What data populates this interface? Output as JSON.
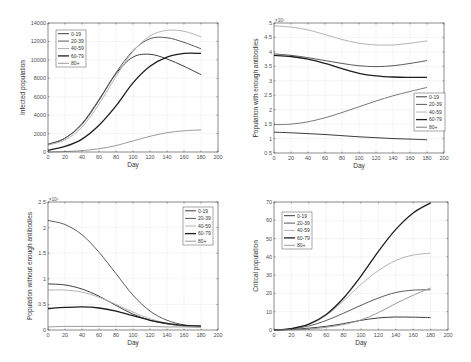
{
  "chart_data": [
    {
      "type": "line",
      "id": "infected",
      "title": "",
      "xlabel": "Day",
      "ylabel": "Infected population",
      "xlim": [
        0,
        200
      ],
      "ylim": [
        0,
        14000
      ],
      "xticks": [
        0,
        20,
        40,
        60,
        80,
        100,
        120,
        140,
        160,
        180,
        200
      ],
      "yticks": [
        0,
        2000,
        4000,
        6000,
        8000,
        10000,
        12000,
        14000
      ],
      "ytick_labels": [
        "0",
        "2000",
        "4000",
        "6000",
        "8000",
        "10000",
        "12000",
        "14000"
      ],
      "exponent": "",
      "grid": true,
      "legend_position": "upper-left",
      "x": [
        0,
        20,
        40,
        60,
        80,
        100,
        120,
        140,
        160,
        180
      ],
      "series": [
        {
          "name": "0-19",
          "color": "#3c3c3c",
          "width": 1.0,
          "values": [
            800,
            1500,
            3000,
            5600,
            8500,
            10300,
            10600,
            10100,
            9300,
            8400
          ]
        },
        {
          "name": "20-39",
          "color": "#5a5a5a",
          "width": 1.0,
          "values": [
            850,
            1500,
            3100,
            5700,
            8600,
            11000,
            12300,
            12400,
            11900,
            11200
          ]
        },
        {
          "name": "40-59",
          "color": "#b4b4b4",
          "width": 1.0,
          "values": [
            750,
            1300,
            2700,
            5200,
            8200,
            10900,
            12600,
            13200,
            13100,
            12500
          ]
        },
        {
          "name": "60-79",
          "color": "#1e1e1e",
          "width": 1.3,
          "values": [
            200,
            600,
            1400,
            2900,
            5000,
            7500,
            9300,
            10300,
            10700,
            10700
          ]
        },
        {
          "name": "80+",
          "color": "#9a9a9a",
          "width": 1.0,
          "values": [
            0,
            50,
            150,
            350,
            700,
            1200,
            1700,
            2100,
            2300,
            2400
          ]
        }
      ]
    },
    {
      "type": "line",
      "id": "with_antibodies",
      "title": "",
      "xlabel": "Day",
      "ylabel": "Population with enough antibodies",
      "xlim": [
        0,
        200
      ],
      "ylim": [
        0.5,
        5
      ],
      "xticks": [
        0,
        20,
        40,
        60,
        80,
        100,
        120,
        140,
        160,
        180,
        200
      ],
      "yticks": [
        0.5,
        1,
        1.5,
        2,
        2.5,
        3,
        3.5,
        4,
        4.5,
        5
      ],
      "ytick_labels": [
        "0.5",
        "1",
        "1.5",
        "2",
        "2.5",
        "3",
        "3.5",
        "4",
        "4.5",
        "5"
      ],
      "exponent": "×10⁴",
      "grid": true,
      "legend_position": "lower-right",
      "x": [
        0,
        20,
        40,
        60,
        80,
        100,
        120,
        140,
        160,
        180
      ],
      "series": [
        {
          "name": "0-19",
          "color": "#3c3c3c",
          "width": 1.0,
          "values": [
            1.22,
            1.2,
            1.17,
            1.14,
            1.1,
            1.06,
            1.03,
            1.0,
            0.98,
            0.96
          ]
        },
        {
          "name": "20-39",
          "color": "#5a5a5a",
          "width": 1.0,
          "values": [
            3.93,
            3.88,
            3.8,
            3.7,
            3.6,
            3.52,
            3.49,
            3.52,
            3.6,
            3.7
          ]
        },
        {
          "name": "40-59",
          "color": "#b4b4b4",
          "width": 1.0,
          "values": [
            4.9,
            4.86,
            4.76,
            4.6,
            4.43,
            4.3,
            4.24,
            4.24,
            4.3,
            4.38
          ]
        },
        {
          "name": "60-79",
          "color": "#1e1e1e",
          "width": 1.3,
          "values": [
            3.88,
            3.84,
            3.75,
            3.6,
            3.42,
            3.26,
            3.17,
            3.13,
            3.12,
            3.12
          ]
        },
        {
          "name": "80+",
          "color": "#7a7a7a",
          "width": 1.0,
          "values": [
            1.48,
            1.5,
            1.58,
            1.72,
            1.9,
            2.1,
            2.3,
            2.48,
            2.63,
            2.77
          ]
        }
      ]
    },
    {
      "type": "line",
      "id": "without_antibodies",
      "title": "",
      "xlabel": "Day",
      "ylabel": "Population without enough antibodies",
      "xlim": [
        0,
        200
      ],
      "ylim": [
        0,
        2.5
      ],
      "xticks": [
        0,
        20,
        40,
        60,
        80,
        100,
        120,
        140,
        160,
        180,
        200
      ],
      "yticks": [
        0,
        0.5,
        1,
        1.5,
        2,
        2.5
      ],
      "ytick_labels": [
        "0",
        "0.5",
        "1",
        "1.5",
        "2",
        "2.5"
      ],
      "exponent": "×10⁵",
      "grid": true,
      "legend_position": "upper-right",
      "x": [
        0,
        20,
        40,
        60,
        80,
        100,
        120,
        140,
        160,
        180
      ],
      "series": [
        {
          "name": "0-19",
          "color": "#3c3c3c",
          "width": 1.0,
          "values": [
            0.9,
            0.88,
            0.8,
            0.66,
            0.48,
            0.31,
            0.19,
            0.12,
            0.08,
            0.07
          ]
        },
        {
          "name": "20-39",
          "color": "#5a5a5a",
          "width": 1.0,
          "values": [
            2.14,
            2.06,
            1.86,
            1.52,
            1.1,
            0.68,
            0.37,
            0.19,
            0.1,
            0.07
          ]
        },
        {
          "name": "40-59",
          "color": "#b4b4b4",
          "width": 1.0,
          "values": [
            0.78,
            0.78,
            0.74,
            0.64,
            0.5,
            0.35,
            0.22,
            0.13,
            0.08,
            0.06
          ]
        },
        {
          "name": "60-79",
          "color": "#1e1e1e",
          "width": 1.3,
          "values": [
            0.42,
            0.44,
            0.45,
            0.43,
            0.37,
            0.28,
            0.19,
            0.13,
            0.09,
            0.08
          ]
        },
        {
          "name": "80+",
          "color": "#9a9a9a",
          "width": 1.0,
          "values": [
            0.06,
            0.07,
            0.07,
            0.07,
            0.07,
            0.07,
            0.07,
            0.06,
            0.06,
            0.05
          ]
        }
      ]
    },
    {
      "type": "line",
      "id": "critical",
      "title": "",
      "xlabel": "Day",
      "ylabel": "Critical population",
      "xlim": [
        0,
        200
      ],
      "ylim": [
        0,
        70
      ],
      "xticks": [
        0,
        20,
        40,
        60,
        80,
        100,
        120,
        140,
        160,
        180,
        200
      ],
      "yticks": [
        0,
        10,
        20,
        30,
        40,
        50,
        60,
        70
      ],
      "ytick_labels": [
        "0",
        "10",
        "20",
        "30",
        "40",
        "50",
        "60",
        "70"
      ],
      "exponent": "",
      "grid": true,
      "legend_position": "upper-left",
      "x": [
        0,
        20,
        40,
        60,
        80,
        100,
        120,
        140,
        160,
        180
      ],
      "series": [
        {
          "name": "0-19",
          "color": "#3c3c3c",
          "width": 1.0,
          "values": [
            0,
            0.3,
            1,
            2,
            3.5,
            5.3,
            6.6,
            7.1,
            7.0,
            6.8
          ]
        },
        {
          "name": "20-39",
          "color": "#5a5a5a",
          "width": 1.0,
          "values": [
            0,
            0.6,
            2.2,
            5.2,
            9.2,
            13.5,
            17.5,
            20.5,
            21.8,
            22.0
          ]
        },
        {
          "name": "40-59",
          "color": "#b4b4b4",
          "width": 1.0,
          "values": [
            0,
            0.8,
            3.0,
            8.0,
            16.0,
            25.0,
            32.5,
            38.0,
            41.0,
            42.0
          ]
        },
        {
          "name": "60-79",
          "color": "#1e1e1e",
          "width": 1.3,
          "values": [
            0,
            0.8,
            3.2,
            8.5,
            17.5,
            29.5,
            43.0,
            55.0,
            64.0,
            69.5
          ]
        },
        {
          "name": "80+",
          "color": "#9a9a9a",
          "width": 1.0,
          "values": [
            0,
            0.1,
            0.5,
            1.5,
            3.0,
            5.5,
            9.5,
            14.5,
            19.0,
            23.0
          ]
        }
      ]
    }
  ],
  "layout": {
    "panels": [
      {
        "left": 48,
        "top": 23,
        "right": 218,
        "bottom": 152
      },
      {
        "left": 274,
        "top": 23,
        "right": 444,
        "bottom": 153
      },
      {
        "left": 48,
        "top": 202,
        "right": 218,
        "bottom": 330
      },
      {
        "left": 274,
        "top": 202,
        "right": 448,
        "bottom": 330
      }
    ],
    "legends": [
      {
        "x": 56,
        "y": 30,
        "w": 30,
        "h": 37
      },
      {
        "x": 414,
        "y": 93,
        "w": 31,
        "h": 38
      },
      {
        "x": 183,
        "y": 207,
        "w": 30,
        "h": 38
      },
      {
        "x": 282,
        "y": 212,
        "w": 30,
        "h": 37
      }
    ]
  }
}
